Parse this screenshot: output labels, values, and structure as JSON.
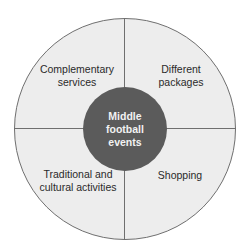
{
  "diagram": {
    "center": {
      "label": "Middle\nfootball\nevents"
    },
    "quadrants": [
      {
        "position": "top-left",
        "label": "Complementary\nservices"
      },
      {
        "position": "top-right",
        "label": "Different\npackages"
      },
      {
        "position": "bottom-left",
        "label": "Traditional and\ncultural activities"
      },
      {
        "position": "bottom-right",
        "label": "Shopping"
      }
    ],
    "colors": {
      "outer_fill": "#ededed",
      "outline": "#6f6f6f",
      "center_fill": "#5b5b5b",
      "center_text": "#f2f2f2",
      "label_text": "#2a2a2a"
    }
  }
}
